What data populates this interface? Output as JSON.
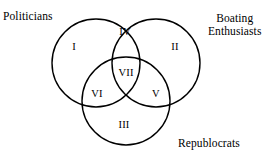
{
  "figure": {
    "type": "venn-diagram-3-set",
    "background_color": "#ffffff",
    "stroke_color": "#000000",
    "stroke_width": 1.4,
    "width": 274,
    "height": 158
  },
  "set_labels": [
    {
      "id": "politicians",
      "text": "Politicians",
      "x": 3,
      "y": 10,
      "align": "left-align"
    },
    {
      "id": "boating-enthusiasts",
      "text": "Boating\nEnthusiasts",
      "x": 208,
      "y": 12,
      "align": "center-align"
    },
    {
      "id": "republocrats",
      "text": "Republocrats",
      "x": 178,
      "y": 137,
      "align": "left-align"
    }
  ],
  "circles": [
    {
      "id": "politicians-circle",
      "cx": 96,
      "cy": 63,
      "r": 44
    },
    {
      "id": "boating-enthusiasts-circle",
      "cx": 156,
      "cy": 63,
      "r": 44
    },
    {
      "id": "republocrats-circle",
      "cx": 126,
      "cy": 101,
      "r": 44
    }
  ],
  "regions": [
    {
      "id": "region-1",
      "label": "I",
      "x": 74,
      "y": 46,
      "sets": "politicians only"
    },
    {
      "id": "region-2",
      "label": "II",
      "x": 175,
      "y": 46,
      "sets": "boating enthusiasts only"
    },
    {
      "id": "region-3",
      "label": "III",
      "x": 124,
      "y": 124,
      "sets": "republocrats only"
    },
    {
      "id": "region-4",
      "label": "IV",
      "x": 125,
      "y": 31,
      "sets": "politicians and boating enthusiasts"
    },
    {
      "id": "region-5",
      "label": "V",
      "x": 156,
      "y": 93,
      "sets": "boating enthusiasts and republocrats"
    },
    {
      "id": "region-6",
      "label": "VI",
      "x": 97,
      "y": 93,
      "sets": "politicians and republocrats"
    },
    {
      "id": "region-7",
      "label": "VII",
      "x": 126,
      "y": 72,
      "sets": "all three sets"
    }
  ]
}
